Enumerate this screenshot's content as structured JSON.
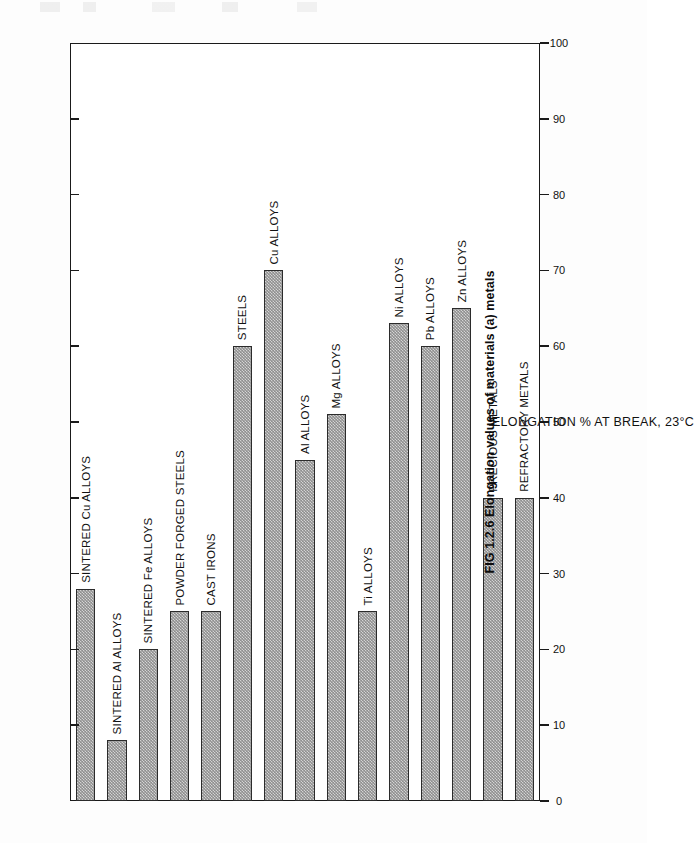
{
  "figure": {
    "caption": "FIG 1.2.6 Elongation values of materials (a) metals",
    "axis_title": "ELONGATION % AT BREAK, 23°C"
  },
  "colors": {
    "bar_fill": "#8f8f8f",
    "bar_outline": "#2b2b2b",
    "axis": "#1a1a1a",
    "text": "#111111",
    "page": "#fdfdfd"
  },
  "chart_data": {
    "type": "bar",
    "title": "FIG 1.2.6 Elongation values of materials (a) metals",
    "orientation": "vertical-rotated",
    "xlabel": "",
    "ylabel": "ELONGATION % AT BREAK, 23°C",
    "ylim": [
      0,
      100
    ],
    "ytick_step": 10,
    "yticks": [
      0,
      10,
      20,
      30,
      40,
      50,
      60,
      70,
      80,
      90,
      100
    ],
    "ytick_labels": [
      "0",
      "10",
      "20",
      "30",
      "40",
      "50",
      "60",
      "70",
      "80",
      "90",
      "100"
    ],
    "grid": false,
    "legend": false,
    "categories": [
      "SINTERED Cu ALLOYS",
      "SINTERED Al ALLOYS",
      "SINTERED Fe ALLOYS",
      "POWDER FORGED STEELS",
      "CAST IRONS",
      "STEELS",
      "Cu ALLOYS",
      "Al ALLOYS",
      "Mg ALLOYS",
      "Ti ALLOYS",
      "Ni ALLOYS",
      "Pb ALLOYS",
      "Zn ALLOYS",
      "PRECIOUS METALS",
      "REFRACTORY METALS"
    ],
    "values": [
      28,
      8,
      20,
      25,
      25,
      60,
      70,
      45,
      51,
      25,
      63,
      60,
      65,
      40,
      40
    ]
  }
}
